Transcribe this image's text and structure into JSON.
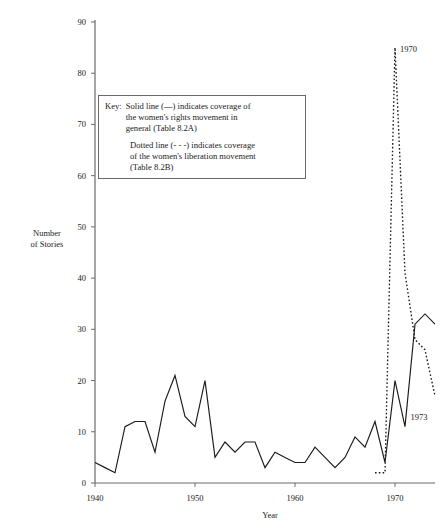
{
  "chart_data": {
    "type": "line",
    "title": "",
    "xlabel": "Year",
    "ylabel": "Number of Stories",
    "xlim": [
      1940,
      1974
    ],
    "ylim": [
      0,
      90
    ],
    "xticks": [
      "1940",
      "1950",
      "1960",
      "1970"
    ],
    "xtick_values": [
      1940,
      1950,
      1960,
      1970
    ],
    "yticks": [
      "0",
      "10",
      "20",
      "30",
      "40",
      "50",
      "60",
      "70",
      "80",
      "90"
    ],
    "ytick_values": [
      0,
      10,
      20,
      30,
      40,
      50,
      60,
      70,
      80,
      90
    ],
    "grid": false,
    "legend_position": "inside-upper-left",
    "series": [
      {
        "name": "Solid line — women's rights movement in general (Table 8.2A)",
        "style": "solid",
        "color": "#1a1a1a",
        "x": [
          1940,
          1941,
          1942,
          1943,
          1944,
          1945,
          1946,
          1947,
          1948,
          1949,
          1950,
          1951,
          1952,
          1953,
          1954,
          1955,
          1956,
          1957,
          1958,
          1959,
          1960,
          1961,
          1962,
          1963,
          1964,
          1965,
          1966,
          1967,
          1968,
          1969,
          1970,
          1971,
          1972,
          1973,
          1974
        ],
        "values": [
          4,
          3,
          2,
          11,
          12,
          12,
          6,
          16,
          21,
          13,
          11,
          20,
          5,
          8,
          6,
          8,
          8,
          3,
          6,
          5,
          4,
          4,
          7,
          5,
          3,
          5,
          9,
          7,
          12,
          4,
          20,
          11,
          31,
          33,
          31
        ]
      },
      {
        "name": "Dotted line - - - women's liberation movement (Table 8.2B)",
        "style": "dotted",
        "color": "#1a1a1a",
        "x": [
          1968,
          1969,
          1970,
          1971,
          1972,
          1973,
          1974
        ],
        "values": [
          2,
          2,
          85,
          41,
          28,
          26,
          17
        ]
      }
    ],
    "annotations": [
      {
        "text": "1970",
        "x": 1970,
        "y": 85,
        "placement": "right"
      },
      {
        "text": "1973",
        "x": 1972,
        "y": 13,
        "placement": "below"
      }
    ]
  },
  "key": {
    "label": "Key:",
    "line1": "Solid line (—) indicates coverage of",
    "line2": "the women's rights movement in",
    "line3": "general (Table 8.2A)",
    "line4": "Dotted line (- - -) indicates coverage",
    "line5": "of the women's liberation movement",
    "line6": "(Table 8.2B)"
  },
  "axes": {
    "y_title_line1": "Number",
    "y_title_line2": "of Stories",
    "x_title": "Year"
  }
}
